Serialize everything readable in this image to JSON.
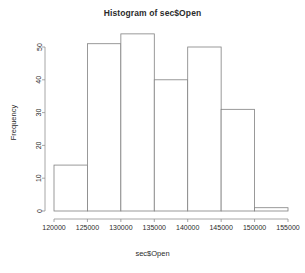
{
  "chart_data": {
    "type": "bar",
    "title": "Histogram of sec$Open",
    "xlabel": "sec$Open",
    "ylabel": "Frequency",
    "categories": [
      "120000-125000",
      "125000-130000",
      "130000-135000",
      "135000-140000",
      "140000-145000",
      "145000-150000",
      "150000-155000"
    ],
    "bin_edges": [
      120000,
      125000,
      130000,
      135000,
      140000,
      145000,
      150000,
      155000
    ],
    "values": [
      14,
      51,
      54,
      40,
      50,
      31,
      1
    ],
    "xlim": [
      120000,
      155000
    ],
    "ylim": [
      0,
      54
    ],
    "xticks": [
      120000,
      125000,
      130000,
      135000,
      140000,
      145000,
      150000,
      155000
    ],
    "xtick_labels": [
      "120000",
      "125000",
      "130000",
      "135000",
      "140000",
      "145000",
      "150000",
      "155000"
    ],
    "yticks": [
      0,
      10,
      20,
      30,
      40,
      50
    ],
    "ytick_labels": [
      "0",
      "10",
      "20",
      "30",
      "40",
      "50"
    ],
    "grid": false,
    "legend": false,
    "bar_fill": "#ffffff",
    "bar_stroke": "#808080",
    "axis_color": "#909090"
  }
}
